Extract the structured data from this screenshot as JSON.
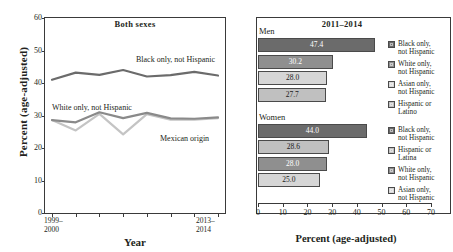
{
  "chart_data": [
    {
      "type": "line",
      "title": "Both sexes",
      "xlabel": "Year",
      "ylabel": "Percent (age-adjusted)",
      "ylim": [
        0,
        60
      ],
      "yticks": [
        "0",
        "10",
        "20",
        "30",
        "40",
        "50",
        "60"
      ],
      "grid": false,
      "legend_position": "inline-labels",
      "x": [
        "1999-2000",
        "2001-2002",
        "2003-2004",
        "2005-2006",
        "2007-2008",
        "2009-2010",
        "2011-2012",
        "2013-2014"
      ],
      "x_tick_labels_shown": [
        "1999–\n2000",
        "2013–\n2014"
      ],
      "x_first_label_line1": "1999–",
      "x_first_label_line2": "2000",
      "x_last_label_line1": "2013–",
      "x_last_label_line2": "2014",
      "series": [
        {
          "name": "Black only, not Hispanic",
          "color": "#6b6b6b",
          "values": [
            41.0,
            43.2,
            42.5,
            44.0,
            42.0,
            42.4,
            43.4,
            42.3
          ]
        },
        {
          "name": "White only, not Hispanic",
          "color": "#8a8a8a",
          "values": [
            28.6,
            27.9,
            31.0,
            29.2,
            30.8,
            29.1,
            29.0,
            29.4
          ]
        },
        {
          "name": "Mexican origin",
          "color": "#c4c4c4",
          "values": [
            28.6,
            25.4,
            30.5,
            24.2,
            30.4,
            28.7,
            28.7,
            29.2
          ]
        }
      ]
    },
    {
      "type": "bar",
      "orientation": "horizontal",
      "title": "2011–2014",
      "xlabel": "Percent (age-adjusted)",
      "ylabel": "",
      "xlim": [
        0,
        70
      ],
      "xticks": [
        "0",
        "10",
        "20",
        "30",
        "40",
        "50",
        "60",
        "70"
      ],
      "grid": false,
      "legend_position": "right",
      "groups": [
        {
          "name": "Men",
          "categories": [
            "Black only, not Hispanic",
            "White only, not Hispanic",
            "Asian only, not Hispanic",
            "Hispanic or Latino"
          ],
          "values": [
            47.4,
            30.2,
            28.0,
            27.7
          ],
          "value_labels": [
            "47.4",
            "30.2",
            "28.0",
            "27.7"
          ],
          "colors": [
            "#6b6b6b",
            "#8f8f8f",
            "#d6d6d6",
            "#c0c0c0"
          ]
        },
        {
          "name": "Women",
          "categories": [
            "Black only, not Hispanic",
            "Hispanic or Latina",
            "White only, not Hispanic",
            "Asian only, not Hispanic"
          ],
          "values": [
            44.0,
            28.6,
            28.0,
            25.0
          ],
          "value_labels": [
            "44.0",
            "28.6",
            "28.0",
            "25.0"
          ],
          "colors": [
            "#6b6b6b",
            "#c0c0c0",
            "#8f8f8f",
            "#d6d6d6"
          ]
        }
      ]
    }
  ],
  "left": {
    "panel_title": "Both sexes",
    "axis_title_y": "Percent (age-adjusted)",
    "axis_title_x": "Year",
    "yticks": [
      "60",
      "50",
      "40",
      "30",
      "20",
      "10",
      "0"
    ],
    "x_first_line1": "1999–",
    "x_first_line2": "2000",
    "x_last_line1": "2013–",
    "x_last_line2": "2014",
    "series_labels": {
      "black": "Black only, not Hispanic",
      "white": "White only, not Hispanic",
      "mexican": "Mexican origin"
    }
  },
  "right": {
    "panel_title": "2011–2014",
    "axis_title_x": "Percent (age-adjusted)",
    "xticks": [
      "0",
      "10",
      "20",
      "30",
      "40",
      "50",
      "60",
      "70"
    ],
    "group_men_title": "Men",
    "group_women_title": "Women",
    "men_values": [
      "47.4",
      "30.2",
      "28.0",
      "27.7"
    ],
    "women_values": [
      "44.0",
      "28.6",
      "28.0",
      "25.0"
    ],
    "legend_men": [
      {
        "l1": "Black only,",
        "l2": "not Hispanic"
      },
      {
        "l1": "White only,",
        "l2": "not Hispanic"
      },
      {
        "l1": "Asian only,",
        "l2": "not Hispanic"
      },
      {
        "l1": "Hispanic or",
        "l2": "Latino"
      }
    ],
    "legend_women": [
      {
        "l1": "Black only,",
        "l2": "not Hispanic"
      },
      {
        "l1": "Hispanic or",
        "l2": "Latina"
      },
      {
        "l1": "White only,",
        "l2": "not Hispanic"
      },
      {
        "l1": "Asian only,",
        "l2": "not Hispanic"
      }
    ]
  },
  "colors": {
    "dark_gray": "#6b6b6b",
    "mid_gray": "#8f8f8f",
    "light_gray": "#d6d6d6",
    "med_light_gray": "#c0c0c0",
    "axis": "#3a3a3a"
  }
}
